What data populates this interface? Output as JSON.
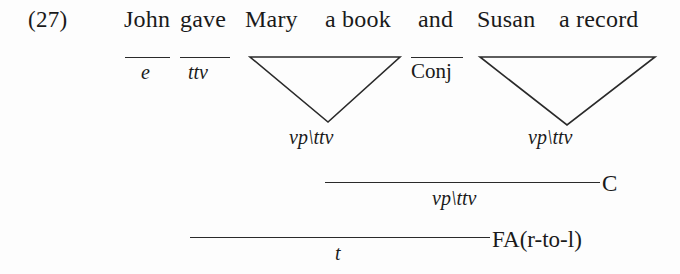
{
  "figure": {
    "example_number": "(27)",
    "caption_kind": "ccg-derivation"
  },
  "surface_string": {
    "words": [
      {
        "text": "John",
        "x": 124
      },
      {
        "text": "gave",
        "x": 180
      },
      {
        "text": "Mary",
        "x": 245
      },
      {
        "text": "a book",
        "x": 325
      },
      {
        "text": "and",
        "x": 418
      },
      {
        "text": "Susan",
        "x": 477
      },
      {
        "text": "a record",
        "x": 559
      }
    ]
  },
  "lexical_categories": [
    {
      "label": "e",
      "under": "John",
      "style": "italic"
    },
    {
      "label": "ttv",
      "under": "gave",
      "style": "italic"
    },
    {
      "label": "Conj",
      "under": "and",
      "style": "upright"
    }
  ],
  "triangles": [
    {
      "name": "triangle-mary-a-book",
      "label": "vp\\ttv",
      "left": 250,
      "right": 400,
      "top": 57,
      "apex_x": 328,
      "apex_y": 122
    },
    {
      "name": "triangle-susan-a-record",
      "label": "vp\\ttv",
      "left": 480,
      "right": 655,
      "top": 57,
      "apex_x": 567,
      "apex_y": 125
    }
  ],
  "derivation_steps": [
    {
      "name": "coordination-step",
      "category": "vp\\ttv",
      "rule_label": "C",
      "line_left": 325,
      "line_right": 600,
      "line_y": 182
    },
    {
      "name": "function-application-step",
      "category": "t",
      "rule_label": "FA(r-to-l)",
      "line_left": 190,
      "line_right": 490,
      "line_y": 237
    }
  ],
  "colors": {
    "background": "#fdfdfd",
    "ink": "#1a1a1a",
    "rule_line": "#2a2a2a"
  }
}
